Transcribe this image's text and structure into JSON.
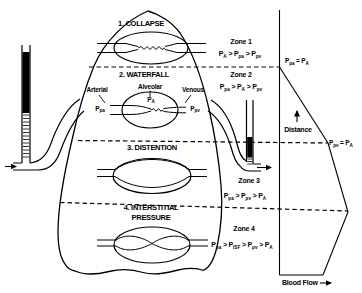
{
  "colors": {
    "ink": "#000000",
    "paper": "#ffffff"
  },
  "lung": {
    "zone1_title": "1. COLLAPSE",
    "zone2_title": "2. WATERFALL",
    "zone3_title": "3. DISTENTION",
    "zone4_title_line1": "4. INTERSTITIAL",
    "zone4_title_line2": "PRESSURE",
    "arterial_label": "Arterial",
    "alveolar_label": "Alveolar",
    "venous_label": "Venous",
    "arterial_pressure": "P_pa",
    "alveolar_pressure": "P_A",
    "venous_pressure": "P_pv"
  },
  "zones": [
    {
      "name": "Zone 1",
      "relation": "P_A > P_pa > P_pv"
    },
    {
      "name": "Zone 2",
      "relation": "P_pa > P_A > P_pv"
    },
    {
      "name": "Zone 3",
      "relation": "P_pa > P_pv > P_A"
    },
    {
      "name": "Zone 4",
      "relation": "P_pa > P_ISF > P_pv > P_A"
    }
  ],
  "graph": {
    "top_boundary_label": "P_pa = P_A",
    "lower_boundary_label": "P_pv = P_A",
    "vertical_axis_label": "Distance",
    "horizontal_axis_label": "Blood Flow"
  }
}
